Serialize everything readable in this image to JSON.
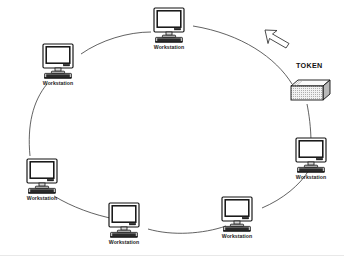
{
  "diagram": {
    "type": "token-ring",
    "background_color": "#ffffff",
    "line_color": "#3a3a3a",
    "text_color": "#1a1a1a",
    "ring": {
      "shape": "ellipse",
      "center_x": 172,
      "center_y": 128,
      "radius_x": 140,
      "radius_y": 108,
      "direction": "counterclockwise"
    },
    "token": {
      "label": "TOKEN",
      "label_x": 296,
      "label_y": 68,
      "box_x": 291,
      "box_y": 80,
      "arrow_name": "token-direction-arrow",
      "arrow_direction": "up-left",
      "pattern": "dotted-hatch"
    },
    "nodes": [
      {
        "id": "ws-top",
        "label": "Workstation",
        "x": 169,
        "y": 16,
        "angle_deg": 90
      },
      {
        "id": "ws-upper-left",
        "label": "Workstation",
        "x": 58,
        "y": 52,
        "angle_deg": 140
      },
      {
        "id": "ws-lower-left",
        "label": "Workstation",
        "x": 42,
        "y": 167,
        "angle_deg": 205
      },
      {
        "id": "ws-bottom-left",
        "label": "Workstation",
        "x": 124,
        "y": 211,
        "angle_deg": 255
      },
      {
        "id": "ws-bottom-right",
        "label": "Workstation",
        "x": 237,
        "y": 205,
        "angle_deg": 295
      },
      {
        "id": "ws-right",
        "label": "Workstation",
        "x": 311,
        "y": 146,
        "angle_deg": 340
      },
      {
        "id": "ws-token-node",
        "label": "Workstation",
        "x": 311,
        "y": 146,
        "angle_deg": 340
      }
    ],
    "node_labels": {
      "top": "Workstation",
      "upper_left": "Workstation",
      "lower_left": "Workstation",
      "bottom_left": "Workstation",
      "bottom_right": "Workstation",
      "right": "Workstation"
    },
    "icons": {
      "workstation": "monitor-icon",
      "token": "token-packet-icon",
      "arrow": "arrow-up-left-icon"
    }
  }
}
